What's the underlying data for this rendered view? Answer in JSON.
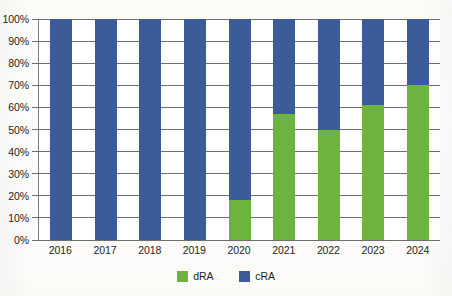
{
  "chart_data": {
    "type": "bar",
    "stacked": true,
    "normalized_percent": true,
    "title": "",
    "subtitle": "",
    "xlabel": "",
    "ylabel": "",
    "categories": [
      "2016",
      "2017",
      "2018",
      "2019",
      "2020",
      "2021",
      "2022",
      "2023",
      "2024"
    ],
    "series": [
      {
        "name": "dRA",
        "color": "#6db33f",
        "values": [
          0,
          0,
          0,
          0,
          18,
          57,
          50,
          61,
          70
        ]
      },
      {
        "name": "cRA",
        "color": "#3c5b99",
        "values": [
          100,
          100,
          100,
          100,
          82,
          43,
          50,
          39,
          30
        ]
      }
    ],
    "ylim": [
      0,
      100
    ],
    "ytick_values": [
      0,
      10,
      20,
      30,
      40,
      50,
      60,
      70,
      80,
      90,
      100
    ],
    "ytick_labels": [
      "0%",
      "10%",
      "20%",
      "30%",
      "40%",
      "50%",
      "60%",
      "70%",
      "80%",
      "90%",
      "100%"
    ],
    "grid": true,
    "grid_axis": "y",
    "legend": {
      "position": "bottom-center",
      "entries": [
        {
          "label": "dRA",
          "color": "#6db33f"
        },
        {
          "label": "cRA",
          "color": "#3c5b99"
        }
      ]
    },
    "axis_color": "#6e6e6e",
    "plot_background": "#ffffff",
    "figure_background": "#fdfdfb"
  }
}
